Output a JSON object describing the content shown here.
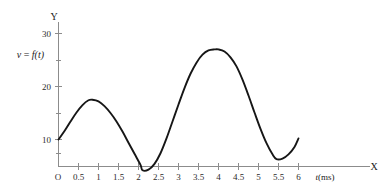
{
  "figure": {
    "title": "",
    "function_label": "v = f(t)",
    "function_label_parts": {
      "variable": "v",
      "equals": " = ",
      "function": "f(t)"
    }
  },
  "axes": {
    "y_axis_name": "Y",
    "x_axis_name": "X",
    "origin_label": "O",
    "x_unit_label": "t(ms)",
    "x_unit_variable": "t",
    "x_unit_suffix": "(ms)",
    "x_ticks": [
      "0.5",
      "1",
      "1.5",
      "2",
      "2.5",
      "3",
      "3.5",
      "4",
      "4.5",
      "5",
      "5.5",
      "6"
    ],
    "x_tick_values": [
      0.5,
      1,
      1.5,
      2,
      2.5,
      3,
      3.5,
      4,
      4.5,
      5,
      5.5,
      6
    ],
    "y_ticks": [
      "10",
      "20",
      "30"
    ],
    "y_tick_values": [
      10,
      20,
      30
    ],
    "y_minor_tick_values": [
      5,
      15,
      25
    ],
    "x_range": [
      0,
      6.6
    ],
    "y_range": [
      0,
      32
    ],
    "grid": false
  },
  "chart_data": {
    "type": "line",
    "title": "",
    "subtitle": "",
    "xlabel": "t(ms)",
    "ylabel": "v = f(t)",
    "xlim": [
      0,
      6.6
    ],
    "ylim": [
      0,
      32
    ],
    "grid": false,
    "legend": "none",
    "series": [
      {
        "name": "v = f(t)",
        "color": "#161616",
        "x": [
          0,
          0.15,
          0.3,
          0.45,
          0.6,
          0.75,
          0.85,
          1.0,
          1.15,
          1.3,
          1.45,
          1.6,
          1.75,
          1.9,
          2.05,
          2.1,
          2.25,
          2.4,
          2.55,
          2.7,
          2.85,
          3.0,
          3.15,
          3.3,
          3.45,
          3.6,
          3.75,
          3.9,
          4.0,
          4.15,
          4.3,
          4.45,
          4.6,
          4.75,
          4.9,
          5.05,
          5.2,
          5.35,
          5.45,
          5.6,
          5.75,
          5.9,
          6.0
        ],
        "y": [
          10.0,
          11.6,
          13.4,
          15.1,
          16.5,
          17.4,
          17.5,
          17.2,
          16.3,
          15.0,
          13.4,
          11.5,
          9.4,
          7.3,
          5.2,
          4.2,
          4.3,
          5.4,
          7.4,
          10.2,
          13.4,
          16.6,
          19.7,
          22.4,
          24.5,
          26.0,
          26.8,
          27.0,
          27.0,
          26.6,
          25.5,
          23.8,
          21.3,
          18.3,
          15.1,
          12.0,
          9.3,
          7.2,
          6.3,
          6.4,
          7.2,
          8.6,
          10.2
        ]
      }
    ],
    "annotations": [
      {
        "label": "local maximum",
        "x": 0.85,
        "y": 17.5
      },
      {
        "label": "local minimum",
        "x": 2.1,
        "y": 4.2
      },
      {
        "label": "global maximum",
        "x": 4.0,
        "y": 27.0
      },
      {
        "label": "local minimum",
        "x": 5.45,
        "y": 6.3
      },
      {
        "label": "start point",
        "x": 0.0,
        "y": 10.0
      },
      {
        "label": "end point",
        "x": 6.0,
        "y": 10.2
      }
    ]
  },
  "colors": {
    "curve": "#161616",
    "axis": "#8c8c8c",
    "text": "#1a1a1a",
    "background": "#ffffff"
  }
}
